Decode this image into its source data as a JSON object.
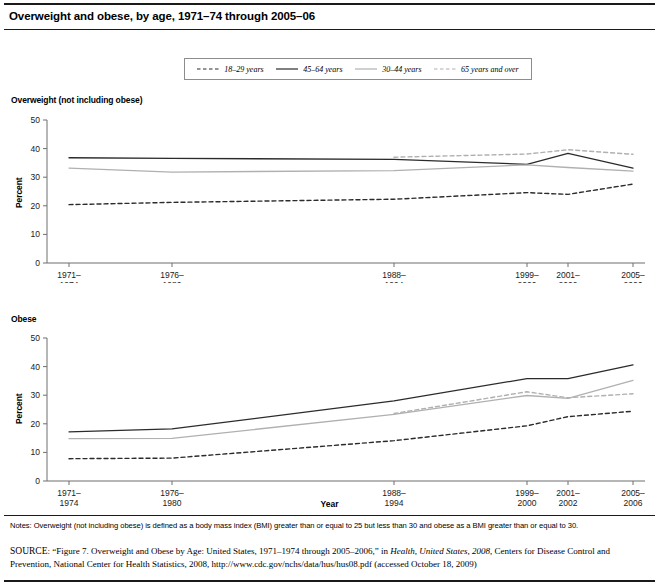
{
  "figure": {
    "title": "Overweight and obese, by age, 1971–74 through 2005–06",
    "xlabel": "Year",
    "notes": "Notes: Overweight (not including obese) is defined as a body mass index (BMI) greater than or equal to 25 but less than 30 and obese as a BMI greater than or equal to 30.",
    "source_prefix": "SOURCE",
    "source_part1": ": “Figure 7. Overweight and Obese by Age: United States, 1971–1974 through 2005–2006,” in ",
    "source_italic": "Health, United States, 2008",
    "source_part2": ", Centers for Disease Control and Prevention, National Center for Health Statistics, 2008, http://www.cdc.gov/nchs/data/hus/hus08.pdf (accessed October 18, 2009)"
  },
  "legend": {
    "items": [
      {
        "label": "18–29 years",
        "color": "#2b2b2b",
        "style": "dashed"
      },
      {
        "label": "45–64 years",
        "color": "#2b2b2b",
        "style": "solid"
      },
      {
        "label": "30–44 years",
        "color": "#b0b0b0",
        "style": "solid"
      },
      {
        "label": "65 years and over",
        "color": "#b0b0b0",
        "style": "dashed"
      }
    ]
  },
  "colors": {
    "dark": "#2b2b2b",
    "light": "#b0b0b0",
    "axis": "#6e6e6e",
    "rule": "#1a1a1a"
  },
  "chart_data": [
    {
      "type": "line",
      "title": "Overweight (not including obese)",
      "xlabel": "Year",
      "ylabel": "Percent",
      "ylim": [
        0,
        50
      ],
      "yticks": [
        0,
        10,
        20,
        30,
        40,
        50
      ],
      "grid": false,
      "legend_position": "top",
      "categories": [
        "1971–1974",
        "1976–1980",
        "1988–1994",
        "1999–2000",
        "2001–2002",
        "2005–2006"
      ],
      "tick_labels_line1": [
        "1971–",
        "1976–",
        "1988–",
        "1999–",
        "2001–",
        "2005–"
      ],
      "tick_labels_line2": [
        "1974",
        "1980",
        "1994",
        "2000",
        "2002",
        "2006"
      ],
      "series": [
        {
          "name": "18–29 years",
          "style": "dashed",
          "color": "#2b2b2b",
          "values": [
            20.4,
            21.2,
            22.3,
            24.6,
            24.0,
            27.6
          ]
        },
        {
          "name": "45–64 years",
          "style": "solid",
          "color": "#2b2b2b",
          "values": [
            36.8,
            36.6,
            36.2,
            34.5,
            38.3,
            33.2
          ]
        },
        {
          "name": "30–44 years",
          "style": "solid",
          "color": "#b0b0b0",
          "values": [
            33.2,
            31.8,
            32.3,
            34.3,
            33.4,
            32.1
          ]
        },
        {
          "name": "65 years and over",
          "style": "dashed",
          "color": "#b0b0b0",
          "values": [
            null,
            null,
            37.0,
            38.1,
            39.6,
            38.0
          ]
        }
      ]
    },
    {
      "type": "line",
      "title": "Obese",
      "xlabel": "Year",
      "ylabel": "Percent",
      "ylim": [
        0,
        50
      ],
      "yticks": [
        0,
        10,
        20,
        30,
        40,
        50
      ],
      "grid": false,
      "legend_position": "top",
      "categories": [
        "1971–1974",
        "1976–1980",
        "1988–1994",
        "1999–2000",
        "2001–2002",
        "2005–2006"
      ],
      "tick_labels_line1": [
        "1971–",
        "1976–",
        "1988–",
        "1999–",
        "2001–",
        "2005–"
      ],
      "tick_labels_line2": [
        "1974",
        "1980",
        "1994",
        "2000",
        "2002",
        "2006"
      ],
      "series": [
        {
          "name": "18–29 years",
          "style": "dashed",
          "color": "#2b2b2b",
          "values": [
            7.8,
            8.0,
            14.1,
            19.3,
            22.5,
            24.4
          ]
        },
        {
          "name": "45–64 years",
          "style": "solid",
          "color": "#2b2b2b",
          "values": [
            17.2,
            18.2,
            28.0,
            35.8,
            35.8,
            40.6
          ]
        },
        {
          "name": "30–44 years",
          "style": "solid",
          "color": "#b0b0b0",
          "values": [
            14.8,
            14.9,
            23.3,
            29.9,
            28.9,
            35.2
          ]
        },
        {
          "name": "65 years and over",
          "style": "dashed",
          "color": "#b0b0b0",
          "values": [
            null,
            null,
            23.6,
            31.2,
            29.1,
            30.5
          ]
        }
      ]
    }
  ]
}
